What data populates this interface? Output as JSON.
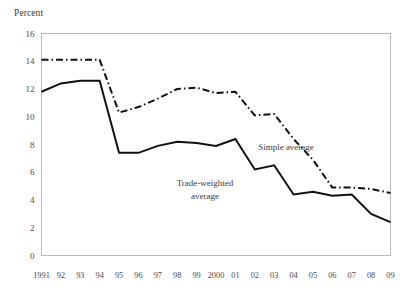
{
  "chart_data": {
    "type": "line",
    "title": "",
    "ylabel": "Percent",
    "xlabel": "",
    "ylim": [
      0,
      16
    ],
    "ytick_step": 2,
    "yticks": [
      "0",
      "2",
      "4",
      "6",
      "8",
      "10",
      "12",
      "14",
      "16"
    ],
    "grid": false,
    "legend_position": "inline-annotations",
    "categories": [
      "1991",
      "92",
      "93",
      "94",
      "95",
      "96",
      "97",
      "98",
      "99",
      "2000",
      "01",
      "02",
      "03",
      "04",
      "05",
      "06",
      "07",
      "08",
      "09"
    ],
    "x": [
      1991,
      1992,
      1993,
      1994,
      1995,
      1996,
      1997,
      1998,
      1999,
      2000,
      2001,
      2002,
      2003,
      2004,
      2005,
      2006,
      2007,
      2008,
      2009
    ],
    "series": [
      {
        "name": "Simple average",
        "style": "dash-dot",
        "color": "#111111",
        "values": [
          14.1,
          14.1,
          14.1,
          14.1,
          10.3,
          10.7,
          11.3,
          12.0,
          12.1,
          11.7,
          11.8,
          10.1,
          10.2,
          8.4,
          6.9,
          4.9,
          4.9,
          4.8,
          4.5
        ]
      },
      {
        "name": "Trade-weighted average",
        "style": "solid",
        "color": "#111111",
        "values": [
          11.8,
          12.4,
          12.6,
          12.6,
          7.4,
          7.4,
          7.9,
          8.2,
          8.1,
          7.9,
          8.4,
          6.2,
          6.5,
          4.4,
          4.6,
          4.3,
          4.4,
          3.0,
          2.4
        ]
      }
    ],
    "annotations": [
      {
        "text": "Simple average",
        "line1": "Simple average",
        "line2": ""
      },
      {
        "text": "Trade-weighted average",
        "line1": "Trade-weighted",
        "line2": "average"
      }
    ],
    "colors": {
      "ink": "#111111",
      "frame": "#b9b9b9",
      "text": "#3a3a3a"
    }
  }
}
